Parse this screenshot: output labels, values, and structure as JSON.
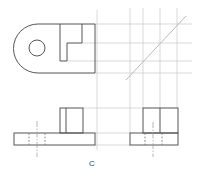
{
  "figure": {
    "label": "C",
    "views": [
      "top-view",
      "front-view",
      "side-view"
    ],
    "colors": {
      "object_line": "#555555",
      "construction_line": "#c8c8c8",
      "hidden_line": "#777777",
      "center_line": "#999999"
    }
  }
}
